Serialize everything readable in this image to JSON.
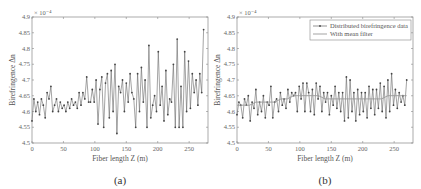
{
  "figure": {
    "panels": [
      {
        "id": "a",
        "caption": "(a)"
      },
      {
        "id": "b",
        "caption": "(b)"
      }
    ]
  },
  "chart_data": [
    {
      "type": "line",
      "panel": "(a)",
      "title": "",
      "xlabel": "Fiber length Z (m)",
      "ylabel": "Birefringence Δn",
      "y_exponent_label": "× 10⁻⁴",
      "xlim": [
        0,
        280
      ],
      "ylim": [
        4.5,
        4.9
      ],
      "xticks": [
        0,
        50,
        100,
        150,
        200,
        250
      ],
      "yticks": [
        4.5,
        4.55,
        4.6,
        4.65,
        4.7,
        4.75,
        4.8,
        4.85,
        4.9
      ],
      "grid": false,
      "series": [
        {
          "name": "Distributed birefringence data",
          "marker": "dot",
          "color": "#555555",
          "x": [
            0,
            3,
            6,
            9,
            12,
            15,
            18,
            21,
            24,
            27,
            30,
            33,
            36,
            39,
            42,
            45,
            48,
            51,
            54,
            57,
            60,
            63,
            66,
            69,
            72,
            75,
            78,
            81,
            84,
            87,
            90,
            93,
            96,
            99,
            102,
            105,
            108,
            111,
            114,
            117,
            120,
            123,
            126,
            129,
            132,
            135,
            138,
            141,
            144,
            147,
            150,
            153,
            156,
            159,
            162,
            165,
            168,
            171,
            174,
            177,
            180,
            183,
            186,
            189,
            192,
            195,
            198,
            201,
            204,
            207,
            210,
            213,
            216,
            219,
            222,
            225,
            228,
            231,
            234,
            237,
            240,
            243,
            246,
            249,
            252,
            255,
            258,
            261,
            264,
            267,
            270,
            273
          ],
          "values": [
            4.57,
            4.64,
            4.6,
            4.63,
            4.59,
            4.64,
            4.62,
            4.58,
            4.66,
            4.64,
            4.68,
            4.6,
            4.62,
            4.64,
            4.6,
            4.63,
            4.61,
            4.62,
            4.6,
            4.63,
            4.61,
            4.64,
            4.62,
            4.63,
            4.61,
            4.66,
            4.62,
            4.66,
            4.64,
            4.71,
            4.63,
            4.63,
            4.67,
            4.63,
            4.7,
            4.56,
            4.67,
            4.71,
            4.55,
            4.69,
            4.72,
            4.58,
            4.73,
            4.6,
            4.75,
            4.53,
            4.68,
            4.66,
            4.7,
            4.6,
            4.69,
            4.63,
            4.72,
            4.66,
            4.64,
            4.55,
            4.72,
            4.6,
            4.74,
            4.63,
            4.7,
            4.55,
            4.81,
            4.58,
            4.62,
            4.65,
            4.6,
            4.79,
            4.62,
            4.68,
            4.57,
            4.73,
            4.59,
            4.64,
            4.63,
            4.75,
            4.55,
            4.83,
            4.55,
            4.68,
            4.55,
            4.79,
            4.6,
            4.76,
            4.61,
            4.72,
            4.66,
            4.7,
            4.62,
            4.72,
            4.66,
            4.86
          ]
        }
      ]
    },
    {
      "type": "line",
      "panel": "(b)",
      "title": "",
      "xlabel": "Fiber length Z (m)",
      "ylabel": "Birefringence Δn",
      "y_exponent_label": "× 10⁻⁴",
      "xlim": [
        0,
        280
      ],
      "ylim": [
        4.5,
        4.9
      ],
      "xticks": [
        0,
        50,
        100,
        150,
        200,
        250
      ],
      "yticks": [
        4.5,
        4.55,
        4.6,
        4.65,
        4.7,
        4.75,
        4.8,
        4.85,
        4.9
      ],
      "grid": false,
      "legend": {
        "position": "upper right",
        "entries": [
          "Distributed birefringence data",
          "With mean filter"
        ]
      },
      "series": [
        {
          "name": "Distributed birefringence data",
          "marker": "dot",
          "color": "#555555",
          "x": [
            0,
            3,
            6,
            9,
            12,
            15,
            18,
            21,
            24,
            27,
            30,
            33,
            36,
            39,
            42,
            45,
            48,
            51,
            54,
            57,
            60,
            63,
            66,
            69,
            72,
            75,
            78,
            81,
            84,
            87,
            90,
            93,
            96,
            99,
            102,
            105,
            108,
            111,
            114,
            117,
            120,
            123,
            126,
            129,
            132,
            135,
            138,
            141,
            144,
            147,
            150,
            153,
            156,
            159,
            162,
            165,
            168,
            171,
            174,
            177,
            180,
            183,
            186,
            189,
            192,
            195,
            198,
            201,
            204,
            207,
            210,
            213,
            216,
            219,
            222,
            225,
            228,
            231,
            234,
            237,
            240,
            243,
            246,
            249,
            252,
            255,
            258,
            261,
            264,
            267,
            270
          ],
          "values": [
            4.59,
            4.63,
            4.62,
            4.58,
            4.64,
            4.62,
            4.65,
            4.57,
            4.63,
            4.61,
            4.67,
            4.59,
            4.63,
            4.6,
            4.65,
            4.58,
            4.63,
            4.62,
            4.68,
            4.58,
            4.63,
            4.64,
            4.6,
            4.66,
            4.62,
            4.64,
            4.61,
            4.67,
            4.63,
            4.66,
            4.65,
            4.66,
            4.6,
            4.68,
            4.64,
            4.69,
            4.6,
            4.69,
            4.66,
            4.6,
            4.67,
            4.59,
            4.69,
            4.64,
            4.68,
            4.6,
            4.66,
            4.63,
            4.66,
            4.59,
            4.65,
            4.62,
            4.68,
            4.61,
            4.66,
            4.6,
            4.66,
            4.57,
            4.71,
            4.58,
            4.7,
            4.6,
            4.66,
            4.57,
            4.67,
            4.59,
            4.66,
            4.6,
            4.66,
            4.58,
            4.68,
            4.61,
            4.67,
            4.59,
            4.67,
            4.61,
            4.69,
            4.6,
            4.68,
            4.58,
            4.7,
            4.6,
            4.72,
            4.62,
            4.67,
            4.61,
            4.66,
            4.63,
            4.65,
            4.62,
            4.7
          ]
        },
        {
          "name": "With mean filter",
          "marker": "none",
          "color": "#888888",
          "x": [
            0,
            10,
            20,
            30,
            40,
            50,
            60,
            70,
            80,
            90,
            100,
            110,
            120,
            130,
            140,
            150,
            160,
            170,
            180,
            190,
            200,
            210,
            220,
            230,
            240,
            250,
            260,
            270
          ],
          "values": [
            4.62,
            4.62,
            4.62,
            4.63,
            4.63,
            4.63,
            4.63,
            4.64,
            4.64,
            4.65,
            4.65,
            4.65,
            4.65,
            4.65,
            4.64,
            4.64,
            4.64,
            4.64,
            4.64,
            4.64,
            4.64,
            4.64,
            4.64,
            4.64,
            4.65,
            4.65,
            4.65,
            4.65
          ]
        }
      ]
    }
  ]
}
